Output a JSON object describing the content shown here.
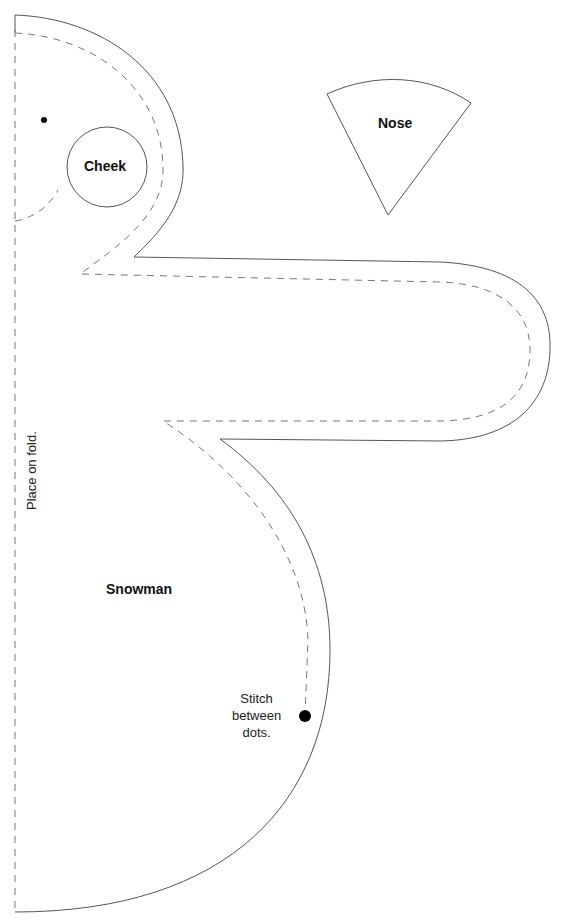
{
  "pattern": {
    "pieces": [
      {
        "id": "snowman",
        "label": "Snowman"
      },
      {
        "id": "cheek",
        "label": "Cheek"
      },
      {
        "id": "nose",
        "label": "Nose"
      }
    ],
    "annotations": {
      "fold": "Place on fold.",
      "stitch_line1": "Stitch",
      "stitch_line2": "between",
      "stitch_line3": "dots."
    },
    "colors": {
      "cut_line": "#555555",
      "sew_line": "#777777",
      "text": "#111111",
      "background": "#ffffff"
    }
  }
}
